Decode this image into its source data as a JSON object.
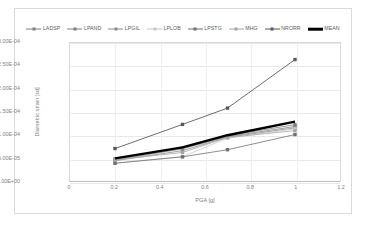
{
  "chart_data": {
    "type": "line",
    "title": "",
    "xlabel": "PGA [g]",
    "ylabel": "Diametric strain [εd]",
    "xlim": [
      0,
      1.2
    ],
    "ylim": [
      0,
      0.0003
    ],
    "grid": true,
    "legend_position": "top",
    "x": [
      0.2,
      0.5,
      0.7,
      1.0
    ],
    "xticks": [
      "0",
      "0.2",
      "0.4",
      "0.6",
      "0.8",
      "1",
      "1.2"
    ],
    "xtick_values": [
      0,
      0.2,
      0.4,
      0.6,
      0.8,
      1.0,
      1.2
    ],
    "yticks": [
      "0.00E+00",
      "5.00E-05",
      "1.00E-04",
      "1.50E-04",
      "2.00E-04",
      "2.50E-04",
      "3.00E-04"
    ],
    "ytick_values": [
      0,
      5e-05,
      0.0001,
      0.00015,
      0.0002,
      0.00025,
      0.0003
    ],
    "series": [
      {
        "name": "LADSP",
        "values": [
          4.8e-05,
          7.2e-05,
          9.85e-05,
          0.0001225
        ],
        "color": "#7f7f7f",
        "marker": "square",
        "width": 0.8
      },
      {
        "name": "LPAND",
        "values": [
          4.55e-05,
          7e-05,
          9.65e-05,
          0.0001185
        ],
        "color": "#808080",
        "marker": "square",
        "width": 0.8
      },
      {
        "name": "LPGIL",
        "values": [
          4.4e-05,
          6.6e-05,
          9.5e-05,
          0.0001155
        ],
        "color": "#8c8c8c",
        "marker": "square",
        "width": 0.8
      },
      {
        "name": "LPLOB",
        "values": [
          3.9e-05,
          5.3e-05,
          9.3e-05,
          0.0001135
        ],
        "color": "#c8c8c8",
        "marker": "square",
        "width": 0.8
      },
      {
        "name": "LPSTG",
        "values": [
          3.85e-05,
          5.25e-05,
          6.8e-05,
          0.000101
        ],
        "color": "#6e6e6e",
        "marker": "square",
        "width": 0.8
      },
      {
        "name": "MHG",
        "values": [
          4.6e-05,
          6.2e-05,
          9.45e-05,
          0.0001095
        ],
        "color": "#a6a6a6",
        "marker": "square",
        "width": 0.8
      },
      {
        "name": "NRORR",
        "values": [
          7.05e-05,
          0.000123,
          0.0001585,
          0.000264
        ],
        "color": "#595959",
        "marker": "square",
        "width": 0.9
      },
      {
        "name": "MEAN",
        "values": [
          4.9e-05,
          7.3e-05,
          9.95e-05,
          0.000129
        ],
        "color": "#000000",
        "marker": "none",
        "width": 2.4
      }
    ]
  }
}
